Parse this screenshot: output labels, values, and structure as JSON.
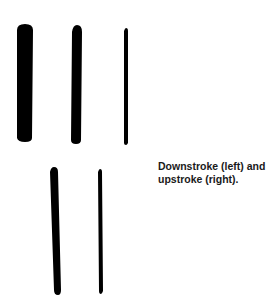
{
  "caption": "Downstroke (left) and upstroke (right).",
  "strokes": {
    "top_row": [
      "thick-stroke",
      "medium-stroke",
      "thin-stroke"
    ],
    "bottom_row": [
      "downstroke",
      "upstroke"
    ]
  },
  "colors": {
    "ink": "#000000",
    "background": "#ffffff"
  }
}
